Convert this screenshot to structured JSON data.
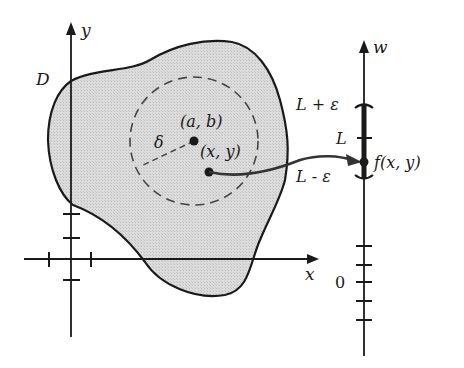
{
  "figure": {
    "region_label": "D",
    "axes": {
      "x_label": "x",
      "y_label": "y",
      "w_label": "w"
    },
    "points": {
      "center_label": "(a, b)",
      "point_label": "(x, y)",
      "radius_label": "δ"
    },
    "w_axis": {
      "upper_bound_label": "L + ε",
      "limit_label": "L",
      "lower_bound_label": "L - ε",
      "value_label": "f(x, y)",
      "zero_label": "0"
    }
  },
  "colors": {
    "ink": "#1a1a1a",
    "region_fill": "#d9d9d9",
    "background": "#ffffff"
  }
}
